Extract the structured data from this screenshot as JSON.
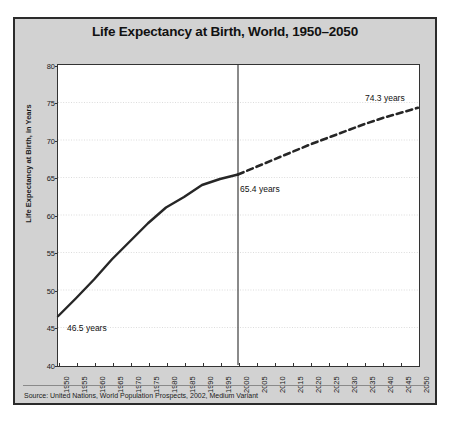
{
  "figure": {
    "title": "Life Expectancy at Birth, World, 1950–2050",
    "source": "Source: United Nations, World Population Prospects, 2002, Medium Variant",
    "panel_color": "#d2d2d2",
    "plot_color": "#ffffff",
    "line_color": "#262626",
    "grid_color": "#d8d8d8"
  },
  "chart_data": {
    "type": "line",
    "title": "Life Expectancy at Birth, World, 1950–2050",
    "xlabel": "",
    "ylabel": "Life Expectancy at Birth, in Years",
    "xlim": [
      1950,
      2050
    ],
    "ylim": [
      40,
      80
    ],
    "ytick_step": 5,
    "xtick_step": 5,
    "grid": true,
    "legend": "none",
    "x": [
      1950,
      1955,
      1960,
      1965,
      1970,
      1975,
      1980,
      1985,
      1990,
      1995,
      2000,
      2005,
      2010,
      2015,
      2020,
      2025,
      2030,
      2035,
      2040,
      2045,
      2050
    ],
    "yticks": [
      40,
      45,
      50,
      55,
      60,
      65,
      70,
      75,
      80
    ],
    "xticks": [
      "1950",
      "1955",
      "1960",
      "1965",
      "1970",
      "1975",
      "1980",
      "1985",
      "1990",
      "1995",
      "2000",
      "2005",
      "2010",
      "2015",
      "2020",
      "2025",
      "2030",
      "2035",
      "2040",
      "2045",
      "2050"
    ],
    "series": [
      {
        "name": "Estimates",
        "style": "solid",
        "x": [
          1950,
          1955,
          1960,
          1965,
          1970,
          1975,
          1980,
          1985,
          1990,
          1995,
          2000
        ],
        "values": [
          46.5,
          48.9,
          51.4,
          54.1,
          56.5,
          58.9,
          61.0,
          62.4,
          64.0,
          64.8,
          65.4
        ]
      },
      {
        "name": "Projections",
        "style": "dashed",
        "x": [
          2000,
          2005,
          2010,
          2015,
          2020,
          2025,
          2030,
          2035,
          2040,
          2045,
          2050
        ],
        "values": [
          65.4,
          66.4,
          67.4,
          68.4,
          69.4,
          70.3,
          71.2,
          72.1,
          72.9,
          73.6,
          74.3
        ]
      }
    ],
    "divider_x": 2000,
    "annotations": [
      {
        "label": "46.5 years",
        "x": 1950,
        "y": 46.5
      },
      {
        "label": "65.4 years",
        "x": 2000,
        "y": 65.4
      },
      {
        "label": "74.3 years",
        "x": 2050,
        "y": 74.3
      }
    ]
  }
}
